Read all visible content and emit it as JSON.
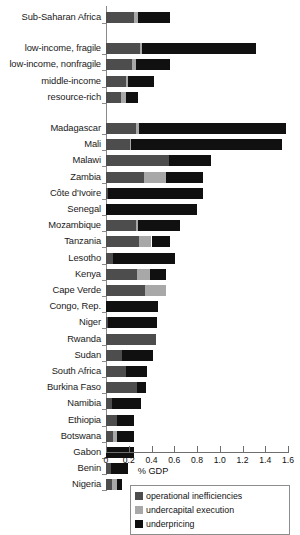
{
  "chart_data": {
    "type": "bar",
    "orientation": "horizontal",
    "stacked": true,
    "title": "",
    "xlabel": "% GDP",
    "ylabel": "",
    "xlim": [
      0,
      1.6
    ],
    "xticks": [
      0,
      0.2,
      0.4,
      0.6,
      0.8,
      1.0,
      1.2,
      1.4,
      1.6
    ],
    "xticklabels": [
      "0",
      "0.2",
      "0.4",
      "0.6",
      "0.8",
      "1.0",
      "1.2",
      "1.4",
      "1.6"
    ],
    "grid": false,
    "legend_position": "bottom",
    "series": [
      {
        "name": "operational inefficiencies",
        "color": "#4d4d4d"
      },
      {
        "name": "undercapital execution",
        "color": "#a8a8a8"
      },
      {
        "name": "underpricing",
        "color": "#101010"
      }
    ],
    "groups": [
      {
        "name": "aggregate",
        "categories": [
          "Sub-Saharan Africa"
        ],
        "values": [
          [
            0.25,
            0.03,
            0.28
          ]
        ]
      },
      {
        "name": "country-groups",
        "categories": [
          "low-income, fragile",
          "low-income, nonfragile",
          "middle-income",
          "resource-rich"
        ],
        "values": [
          [
            0.3,
            0.02,
            1.0
          ],
          [
            0.23,
            0.03,
            0.3
          ],
          [
            0.18,
            0.01,
            0.23
          ],
          [
            0.13,
            0.05,
            0.1
          ]
        ]
      },
      {
        "name": "countries",
        "categories": [
          "Madagascar",
          "Mali",
          "Malawi",
          "Zambia",
          "Côte d'Ivoire",
          "Senegal",
          "Mozambique",
          "Tanzania",
          "Lesotho",
          "Kenya",
          "Cape Verde",
          "Congo, Rep.",
          "Niger",
          "Rwanda",
          "Sudan",
          "South Africa",
          "Burkina Faso",
          "Namibia",
          "Ethiopia",
          "Botswana",
          "Gabon",
          "Benin",
          "Nigeria"
        ],
        "values": [
          [
            0.26,
            0.03,
            1.29
          ],
          [
            0.21,
            0.01,
            1.33
          ],
          [
            0.55,
            0.0,
            0.37
          ],
          [
            0.33,
            0.2,
            0.32
          ],
          [
            0.02,
            0.0,
            0.83
          ],
          [
            0.0,
            0.0,
            0.8
          ],
          [
            0.26,
            0.02,
            0.37
          ],
          [
            0.29,
            0.11,
            0.16
          ],
          [
            0.06,
            0.0,
            0.55
          ],
          [
            0.27,
            0.12,
            0.14
          ],
          [
            0.34,
            0.19,
            0.0
          ],
          [
            0.0,
            0.0,
            0.46
          ],
          [
            0.02,
            0.0,
            0.43
          ],
          [
            0.44,
            0.0,
            0.0
          ],
          [
            0.14,
            0.0,
            0.27
          ],
          [
            0.18,
            0.0,
            0.18
          ],
          [
            0.27,
            0.0,
            0.08
          ],
          [
            0.05,
            0.0,
            0.26
          ],
          [
            0.1,
            0.0,
            0.15
          ],
          [
            0.06,
            0.04,
            0.15
          ],
          [
            0.0,
            0.0,
            0.25
          ],
          [
            0.04,
            0.0,
            0.15
          ],
          [
            0.05,
            0.05,
            0.04
          ]
        ]
      }
    ]
  },
  "legend": {
    "items": [
      {
        "label": "operational inefficiencies",
        "key": "op"
      },
      {
        "label": "undercapital execution",
        "key": "uc"
      },
      {
        "label": "underpricing",
        "key": "up"
      }
    ]
  }
}
